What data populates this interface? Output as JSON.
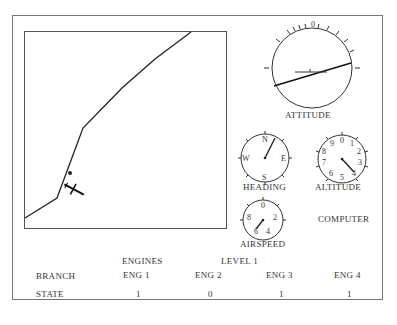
{
  "instruments": {
    "attitude": {
      "label": "ATTITUDE",
      "scale_mark": "0"
    },
    "heading": {
      "label": "HEADING",
      "marks": [
        "N",
        "E",
        "S",
        "W"
      ]
    },
    "altitude": {
      "label": "ALTITUDE",
      "marks": [
        "0",
        "1",
        "2",
        "3",
        "4",
        "5",
        "6",
        "7",
        "8",
        "9"
      ]
    },
    "airspeed": {
      "label": "AIRSPEED",
      "marks": [
        "0",
        "2",
        "4",
        "6",
        "8"
      ]
    }
  },
  "computer": {
    "label": "COMPUTER"
  },
  "table": {
    "section_label": "ENGINES",
    "level_label": "LEVEL 1",
    "row_headers": {
      "branch": "BRANCH",
      "state": "STATE"
    },
    "columns": [
      {
        "branch": "ENG 1",
        "state": "1"
      },
      {
        "branch": "ENG 2",
        "state": "0"
      },
      {
        "branch": "ENG 3",
        "state": "1"
      },
      {
        "branch": "ENG 4",
        "state": "1"
      }
    ]
  }
}
